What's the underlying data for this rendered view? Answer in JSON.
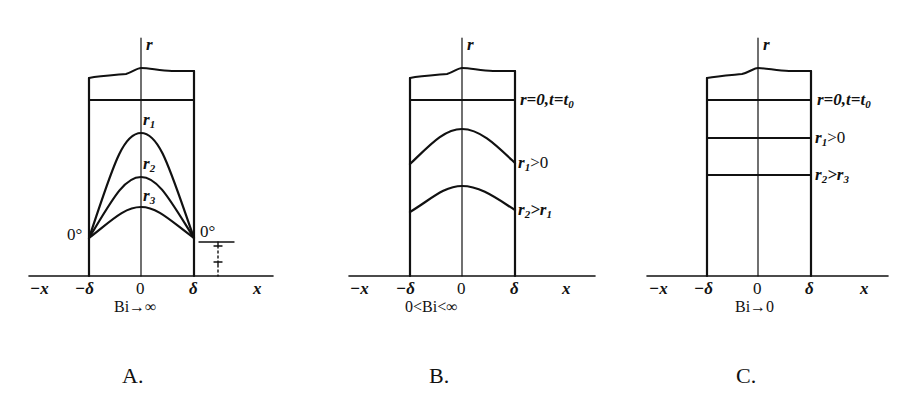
{
  "figure": {
    "panels": [
      {
        "id": "A",
        "caption": "A.",
        "condition": "Bi→∞",
        "axis_label_vertical": "r",
        "x_ticks": [
          "−x",
          "−δ",
          "0",
          "δ",
          "x"
        ],
        "curve_labels": [
          "r1",
          "r2",
          "r3"
        ],
        "wall_temp_left": "0°",
        "wall_temp_right": "0°",
        "profile_shape": "parabolic curves pinned to 0° at both walls"
      },
      {
        "id": "B",
        "caption": "B.",
        "condition": "0<Bi<∞",
        "axis_label_vertical": "r",
        "x_ticks": [
          "−x",
          "−δ",
          "0",
          "δ",
          "x"
        ],
        "curve_labels": [
          "r=0,t=t0",
          "r1>0",
          "r2>r1"
        ],
        "profile_shape": "flattened curves, wall temperatures decrease"
      },
      {
        "id": "C",
        "caption": "C.",
        "condition": "Bi→0",
        "axis_label_vertical": "r",
        "x_ticks": [
          "−x",
          "−δ",
          "0",
          "δ",
          "x"
        ],
        "curve_labels": [
          "r=0,t=t0",
          "r1>0",
          "r2>r3"
        ],
        "profile_shape": "uniform horizontal lines"
      }
    ]
  },
  "labels": {
    "r": "r",
    "neg_x": "−x",
    "neg_delta": "−δ",
    "zero": "0",
    "delta": "δ",
    "x": "x",
    "deg0": "0°",
    "a": {
      "r1": "r",
      "r1s": "1",
      "r2": "r",
      "r2s": "2",
      "r3": "r",
      "r3s": "3",
      "cond": "Bi→∞",
      "cap": "A."
    },
    "b": {
      "l0a": "r=0,t=t",
      "l0s": "0",
      "l1a": "r",
      "l1s": "1",
      "l1b": ">0",
      "l2a": "r",
      "l2s": "2",
      "l2b": ">r",
      "l2s2": "1",
      "cond": "0<Bi<∞",
      "cap": "B."
    },
    "c": {
      "l0a": "r=0,t=t",
      "l0s": "0",
      "l1a": "r",
      "l1s": "1",
      "l1b": ">0",
      "l2a": "r",
      "l2s": "2",
      "l2b": ">r",
      "l2s2": "3",
      "cond": "Bi→0",
      "cap": "C."
    }
  }
}
